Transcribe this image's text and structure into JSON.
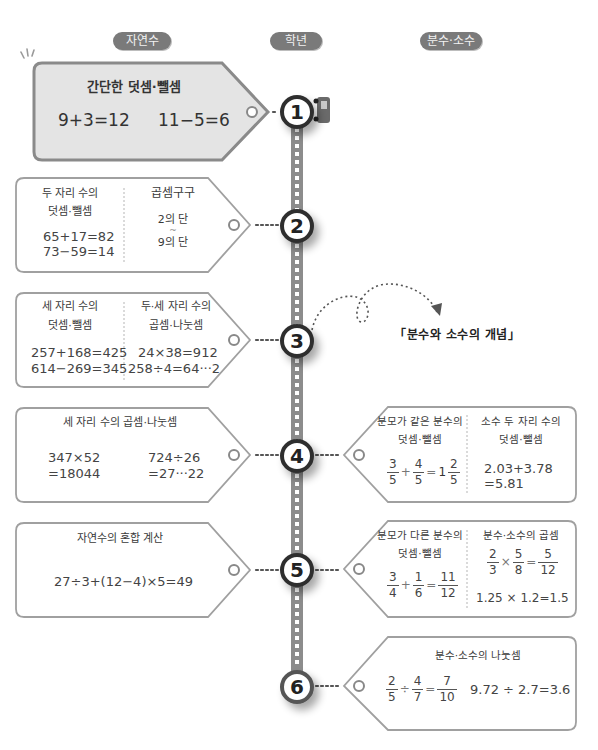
{
  "header": {
    "natural": "자연수",
    "grade": "학년",
    "fraction": "분수·소수"
  },
  "colors": {
    "pill_bg": "#7a7a7a",
    "road": "#8c8c8c",
    "card_border": "#9a9a9a",
    "card1_fill": "#e4e4e4",
    "circle_ring": "#3a3a3a"
  },
  "grades": [
    "1",
    "2",
    "3",
    "4",
    "5",
    "6"
  ],
  "note": "「분수와 소수의 개념」",
  "left": {
    "g1": {
      "title": "간단한 덧셈·뺄셈",
      "eq1": "9+3=12",
      "eq2": "11−5=6"
    },
    "g2": {
      "col1_title_l1": "두 자리 수의",
      "col1_title_l2": "덧셈·뺄셈",
      "col1_eq1": "65+17=82",
      "col1_eq2": "73−59=14",
      "col2_title": "곱셈구구",
      "col2_l1": "2의 단",
      "col2_l2": "~",
      "col2_l3": "9의 단"
    },
    "g3": {
      "col1_title_l1": "세 자리 수의",
      "col1_title_l2": "덧셈·뺄셈",
      "col1_eq1": "257+168=425",
      "col1_eq2": "614−269=345",
      "col2_title_l1": "두·세 자리 수의",
      "col2_title_l2": "곱셈·나눗셈",
      "col2_eq1": "24×38=912",
      "col2_eq2": "258÷4=64···2"
    },
    "g4": {
      "title": "세 자리 수의 곱셈·나눗셈",
      "eq1_l1": "347×52",
      "eq1_l2": "=18044",
      "eq2_l1": "724÷26",
      "eq2_l2": "=27···22"
    },
    "g5": {
      "title": "자연수의 혼합 계산",
      "eq": "27÷3+(12−4)×5=49"
    }
  },
  "right": {
    "g4": {
      "col1_title_l1": "분모가 같은 분수의",
      "col1_title_l2": "덧셈·뺄셈",
      "col1_f1n": "3",
      "col1_f1d": "5",
      "col1_op": "+",
      "col1_f2n": "4",
      "col1_f2d": "5",
      "col1_eq": "=",
      "col1_whole": "1",
      "col1_f3n": "2",
      "col1_f3d": "5",
      "col2_title_l1": "소수 두 자리 수의",
      "col2_title_l2": "덧셈·뺄셈",
      "col2_eq1": "2.03+3.78",
      "col2_eq2": "=5.81"
    },
    "g5": {
      "col1_title_l1": "분모가 다른 분수의",
      "col1_title_l2": "덧셈·뺄셈",
      "col1_f1n": "3",
      "col1_f1d": "4",
      "col1_op": "+",
      "col1_f2n": "1",
      "col1_f2d": "6",
      "col1_eq": "=",
      "col1_f3n": "11",
      "col1_f3d": "12",
      "col2_title": "분수·소수의 곱셈",
      "col2_f1n": "2",
      "col2_f1d": "3",
      "col2_op": "×",
      "col2_f2n": "5",
      "col2_f2d": "8",
      "col2_eq": "=",
      "col2_f3n": "5",
      "col2_f3d": "12",
      "col2_eq2": "1.25 × 1.2=1.5"
    },
    "g6": {
      "title": "분수·소수의 나눗셈",
      "f1n": "2",
      "f1d": "5",
      "op": "÷",
      "f2n": "4",
      "f2d": "7",
      "eq": "=",
      "f3n": "7",
      "f3d": "10",
      "eq2": "9.72 ÷ 2.7=3.6"
    }
  }
}
